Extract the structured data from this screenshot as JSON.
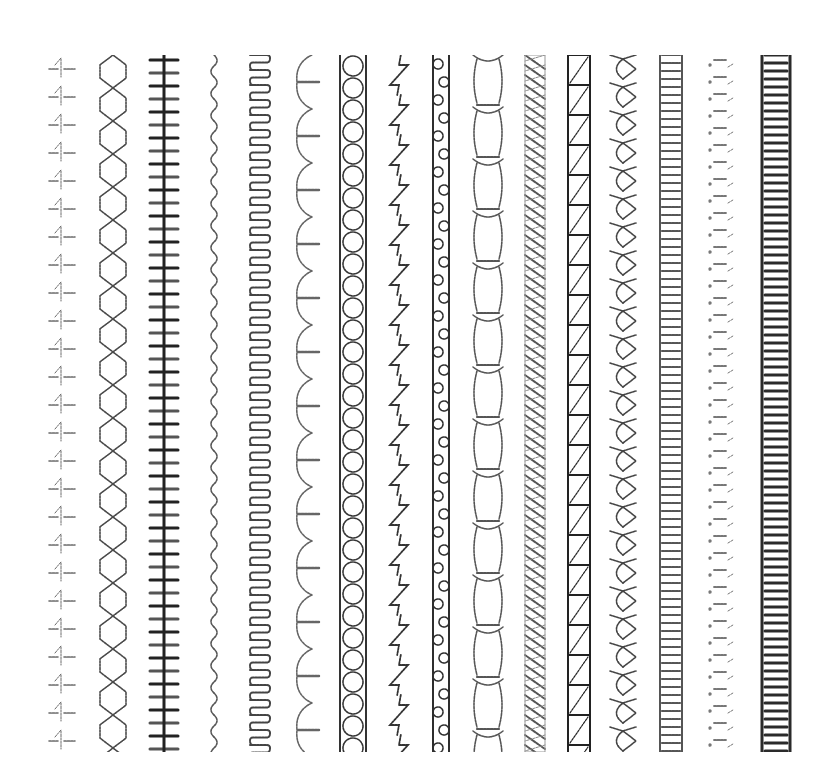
{
  "image": {
    "width": 836,
    "height": 782,
    "background": "#ffffff",
    "top": 55,
    "bottom": 752
  },
  "columns": [
    {
      "name": "arrow-dash-stitch",
      "cx": 62,
      "w": 30,
      "period": 28,
      "style": "arrowdash",
      "color": "#6a6a6a"
    },
    {
      "name": "hexagon-chain-stitch",
      "cx": 113,
      "w": 26,
      "period": 33,
      "style": "hexchain",
      "color": "#4a4a4a"
    },
    {
      "name": "bar-spine-stitch",
      "cx": 164,
      "w": 28,
      "period": 13,
      "style": "spine",
      "color": "#222222"
    },
    {
      "name": "serpentine-stitch",
      "cx": 214,
      "w": 12,
      "period": 22,
      "style": "wave",
      "color": "#555555"
    },
    {
      "name": "meander-stitch",
      "cx": 260,
      "w": 20,
      "period": 15,
      "style": "meander",
      "color": "#444444"
    },
    {
      "name": "blanket-curve-stitch",
      "cx": 307,
      "w": 24,
      "period": 54,
      "style": "blanket",
      "color": "#666666"
    },
    {
      "name": "ladder-circle-stitch",
      "cx": 353,
      "w": 26,
      "period": 22,
      "style": "ladderring",
      "color": "#333333"
    },
    {
      "name": "zigzag-stitch",
      "cx": 399,
      "w": 18,
      "period": 40,
      "style": "zigzag",
      "color": "#333333"
    },
    {
      "name": "rope-chain-stitch",
      "cx": 441,
      "w": 16,
      "period": 18,
      "style": "rope",
      "color": "#2e2e2e"
    },
    {
      "name": "scallop-circle-stitch",
      "cx": 488,
      "w": 30,
      "period": 52,
      "style": "scallop",
      "color": "#555555"
    },
    {
      "name": "diagonal-weave-stitch",
      "cx": 535,
      "w": 20,
      "period": 10,
      "style": "weave",
      "color": "#555555"
    },
    {
      "name": "box-diagonal-stitch",
      "cx": 579,
      "w": 22,
      "period": 30,
      "style": "boxdiag",
      "color": "#222222"
    },
    {
      "name": "cross-scallop-stitch",
      "cx": 623,
      "w": 26,
      "period": 28,
      "style": "crossscallop",
      "color": "#444444"
    },
    {
      "name": "dense-ladder-stitch",
      "cx": 671,
      "w": 22,
      "period": 8,
      "style": "denseladder",
      "color": "#555555"
    },
    {
      "name": "dotted-dash-stitch",
      "cx": 721,
      "w": 26,
      "period": 17,
      "style": "dotdash",
      "color": "#777777"
    },
    {
      "name": "heavy-ladder-stitch",
      "cx": 776,
      "w": 28,
      "period": 8,
      "style": "heavyladder",
      "color": "#2a2a2a"
    }
  ]
}
